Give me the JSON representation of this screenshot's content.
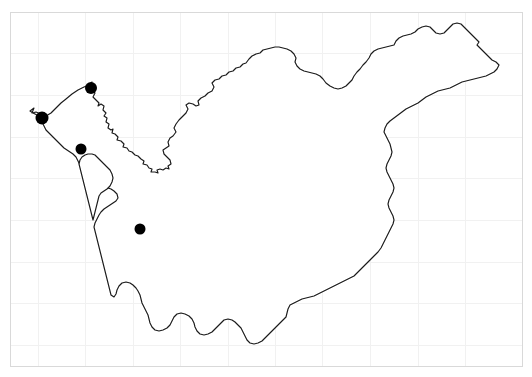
{
  "figure": {
    "name": "region-outline-map",
    "kind": "map",
    "width": 532,
    "height": 377,
    "background_color": "#ffffff",
    "title": "",
    "subtitle": "",
    "caption": "",
    "axis_labels": {
      "x": "",
      "y": ""
    },
    "tick_labels": {
      "x": [],
      "y": []
    },
    "legend": {
      "visible": false,
      "entries": []
    },
    "annotations": []
  },
  "plot_frame": {
    "visible": true,
    "color": "#d9d9d9",
    "stroke_width": 1,
    "left": 10,
    "top": 12,
    "right": 522,
    "bottom": 366
  },
  "grid": {
    "visible": true,
    "color": "#f1f1f1",
    "stroke_width": 1,
    "vertical_x": [
      38,
      85,
      133,
      180,
      228,
      275,
      322,
      370,
      418,
      465
    ],
    "horizontal_y": [
      53,
      95,
      137,
      178,
      220,
      262,
      303,
      345
    ]
  },
  "region": {
    "name": "province-boundary",
    "fill_color": "#ffffff",
    "stroke_color": "#1a1a1a",
    "stroke_width": 1.15,
    "outline_path": "M 30 111 L 34 108 L 32 113 L 36 112 L 41 114 L 44 113 L 46 116 L 44 119 L 47 120 L 46 116 L 51 113 L 56 108 L 61 103 L 66 99 L 72 94 L 78 90 L 84 87 L 89 85 L 92 82 L 90 86 L 92 89 L 95 93 L 93 97 L 96 100 L 99 103 L 98 106 L 101 104 L 104 106 L 103 110 L 106 113 L 104 116 L 107 118 L 106 122 L 109 124 L 108 128 L 111 130 L 113 129 L 112 133 L 115 134 L 118 137 L 117 140 L 121 141 L 124 144 L 123 147 L 127 148 L 129 151 L 132 152 L 135 155 L 138 156 L 141 159 L 144 161 L 143 164 L 147 165 L 149 168 L 152 169 L 151 172 L 155 172 L 158 173 L 157 170 L 160 169 L 163 170 L 166 168 L 169 169 L 168 166 L 171 164 L 170 160 L 167 157 L 164 154 L 163 150 L 166 148 L 169 146 L 168 142 L 170 138 L 173 136 L 176 132 L 174 128 L 176 124 L 179 120 L 182 117 L 186 113 L 188 109 L 186 105 L 189 103 L 193 104 L 196 106 L 199 105 L 198 101 L 201 98 L 205 96 L 208 93 L 212 91 L 214 87 L 212 83 L 215 80 L 219 79 L 222 76 L 226 75 L 229 72 L 233 71 L 236 68 L 240 67 L 243 64 L 246 63 L 249 59 L 252 56 L 256 54 L 260 53 L 263 50 L 267 49 L 271 48 L 275 47 L 279 47 L 283 48 L 287 49 L 291 51 L 294 54 L 296 58 L 295 62 L 297 66 L 300 69 L 304 71 L 308 72 L 312 73 L 316 74 L 320 76 L 323 79 L 326 83 L 330 86 L 334 88 L 338 89 L 342 88 L 346 86 L 349 83 L 352 80 L 354 76 L 357 72 L 360 69 L 363 65 L 366 62 L 369 58 L 371 54 L 374 51 L 378 49 L 382 48 L 386 47 L 390 46 L 394 45 L 396 41 L 399 38 L 403 36 L 407 35 L 411 34 L 415 32 L 418 29 L 422 27 L 426 26 L 430 27 L 433 30 L 436 33 L 440 34 L 444 33 L 447 30 L 450 27 L 453 24 L 457 23 L 461 24 L 464 27 L 467 30 L 470 33 L 473 36 L 476 39 L 479 42 L 477 45 L 480 48 L 483 51 L 486 54 L 489 57 L 492 60 L 496 62 L 499 65 L 497 69 L 494 72 L 490 74 L 486 76 L 482 77 L 478 78 L 474 79 L 470 80 L 466 81 L 462 82 L 458 84 L 454 86 L 450 88 L 446 89 L 442 90 L 438 91 L 434 93 L 430 95 L 426 97 L 422 100 L 418 103 L 414 105 L 410 107 L 406 109 L 402 112 L 398 115 L 394 118 L 390 121 L 387 124 L 385 128 L 384 132 L 386 136 L 388 140 L 390 144 L 391 148 L 392 152 L 391 156 L 389 160 L 387 164 L 386 168 L 387 172 L 389 176 L 391 180 L 393 184 L 394 188 L 393 192 L 391 196 L 389 200 L 388 204 L 389 208 L 391 212 L 393 216 L 394 220 L 393 224 L 391 228 L 389 232 L 387 236 L 385 240 L 383 244 L 381 248 L 378 252 L 375 255 L 372 258 L 369 261 L 366 264 L 363 267 L 360 270 L 357 273 L 354 276 L 350 278 L 346 280 L 342 282 L 338 284 L 334 286 L 330 288 L 326 290 L 322 292 L 318 294 L 314 296 L 310 297 L 306 298 L 302 299 L 298 301 L 294 303 L 290 305 L 288 309 L 287 313 L 286 317 L 283 320 L 280 323 L 277 326 L 274 329 L 271 332 L 268 335 L 265 338 L 262 341 L 258 343 L 254 344 L 250 343 L 247 340 L 245 336 L 243 332 L 241 328 L 238 325 L 235 322 L 232 320 L 228 319 L 224 320 L 221 323 L 218 326 L 215 329 L 212 332 L 208 334 L 204 335 L 200 334 L 197 331 L 195 327 L 194 323 L 192 319 L 189 316 L 185 314 L 181 313 L 177 314 L 174 317 L 172 321 L 170 325 L 167 328 L 163 330 L 159 331 L 155 330 L 152 327 L 150 323 L 149 319 L 148 315 L 146 311 L 144 307 L 142 303 L 141 299 L 140 295 L 138 291 L 136 288 L 133 285 L 130 283 L 126 282 L 122 283 L 119 286 L 117 290 L 116 294 L 114 297 L 111 295 L 110 291 L 109 287 L 108 283 L 107 279 L 106 275 L 105 271 L 104 267 L 103 263 L 102 259 L 101 255 L 100 251 L 99 247 L 98 243 L 97 239 L 96 235 L 95 231 L 94 227 L 95 223 L 97 219 L 99 215 L 101 212 L 104 209 L 107 207 L 110 205 L 113 203 L 116 201 L 118 198 L 117 194 L 114 191 L 111 189 L 108 188 L 104 188 L 101 190 L 98 193 L 96 197 L 95 201 L 94 205 L 92 209 L 90 205 L 89 201 L 88 197 L 87 193 L 86 189 L 85 185 L 84 181 L 83 177 L 82 173 L 81 169 L 80 165 L 78 161 L 76 157 L 73 154 L 70 152 L 67 150 L 64 148 L 61 145 L 58 142 L 55 139 L 52 136 L 49 133 L 46 130 L 44 126 L 42 122 L 40 118 L 37 115 L 33 113 Z",
    "inner_path": "M 95 155 L 98 158 L 101 161 L 104 164 L 107 167 L 110 170 L 112 174 L 113 178 L 112 182 L 110 186 L 107 189 L 104 191 L 101 193 L 99 196 L 98 200 L 97 204 L 96 208 L 95 212 L 94 216 L 93 220 L 92 216 L 91 212 L 90 208 L 89 204 L 88 200 L 87 196 L 86 192 L 85 188 L 84 184 L 83 180 L 82 176 L 81 172 L 80 168 L 79 164 L 80 160 L 82 157 L 85 155 L 88 154 L 92 154 Z"
  },
  "sites": {
    "name": "sampling-locations",
    "marker_color": "#000000",
    "marker_shape": "circle",
    "marker_radius": 5.5,
    "count": 4,
    "points": [
      {
        "label": "",
        "x": 91,
        "y": 88,
        "r": 6
      },
      {
        "label": "",
        "x": 42,
        "y": 118,
        "r": 6.5
      },
      {
        "label": "",
        "x": 81,
        "y": 149,
        "r": 5.5
      },
      {
        "label": "",
        "x": 140,
        "y": 229,
        "r": 5.5
      }
    ]
  }
}
